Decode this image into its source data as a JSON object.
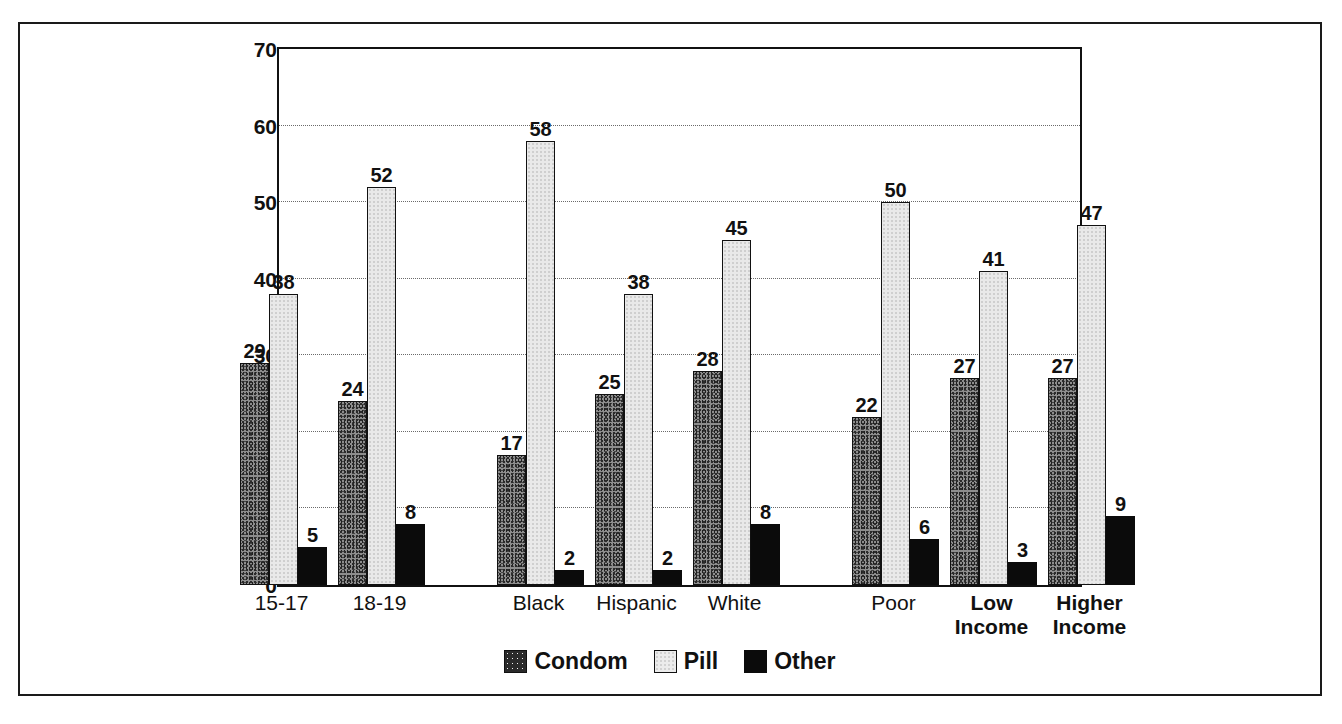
{
  "chart_data": {
    "type": "bar",
    "title": "",
    "subtitle": "",
    "xlabel": "",
    "ylabel": "",
    "ylim": [
      0,
      70
    ],
    "ytick_step": 10,
    "yticks": [
      0,
      10,
      20,
      30,
      40,
      50,
      60,
      70
    ],
    "grid": true,
    "grid_style": "dotted-horizontal",
    "legend_position": "bottom-center",
    "value_labels": true,
    "categories": [
      "15-17",
      "18-19",
      "Black",
      "Hispanic",
      "White",
      "Poor",
      "Low\nIncome",
      "Higher\nIncome"
    ],
    "category_groups": [
      {
        "name": "age",
        "categories": [
          "15-17",
          "18-19"
        ]
      },
      {
        "name": "race-ethnicity",
        "categories": [
          "Black",
          "Hispanic",
          "White"
        ]
      },
      {
        "name": "income",
        "categories": [
          "Poor",
          "Low\nIncome",
          "Higher\nIncome"
        ]
      }
    ],
    "series": [
      {
        "name": "Condom",
        "color": "#8d8d8d",
        "values": [
          29,
          24,
          17,
          25,
          28,
          22,
          27,
          27
        ]
      },
      {
        "name": "Pill",
        "color": "#e9e9e9",
        "values": [
          38,
          52,
          58,
          38,
          45,
          50,
          41,
          47
        ]
      },
      {
        "name": "Other",
        "color": "#0b0b0b",
        "values": [
          5,
          8,
          2,
          2,
          8,
          6,
          3,
          9
        ]
      }
    ],
    "legend": [
      {
        "label": "Condom",
        "swatch": "condom"
      },
      {
        "label": "Pill",
        "swatch": "pill"
      },
      {
        "label": "Other",
        "swatch": "other"
      }
    ]
  },
  "axis": {
    "y_tick_labels": [
      "70",
      "60",
      "50",
      "40",
      "30",
      "20",
      "10",
      "0"
    ],
    "x_tick_labels": [
      {
        "text": "15-17",
        "bold": false
      },
      {
        "text": "18-19",
        "bold": false
      },
      {
        "text": "Black",
        "bold": false
      },
      {
        "text": "Hispanic",
        "bold": false
      },
      {
        "text": "White",
        "bold": false
      },
      {
        "text": "Poor",
        "bold": false
      },
      {
        "text": "Low\nIncome",
        "bold": true
      },
      {
        "text": "Higher\nIncome",
        "bold": true
      }
    ]
  },
  "colors": {
    "frame": "#1a1a1a",
    "axis": "#111111",
    "gridline": "#6a6a6a",
    "condom": "#8d8d8d",
    "pill": "#e9e9e9",
    "other": "#0b0b0b",
    "background": "#ffffff"
  }
}
